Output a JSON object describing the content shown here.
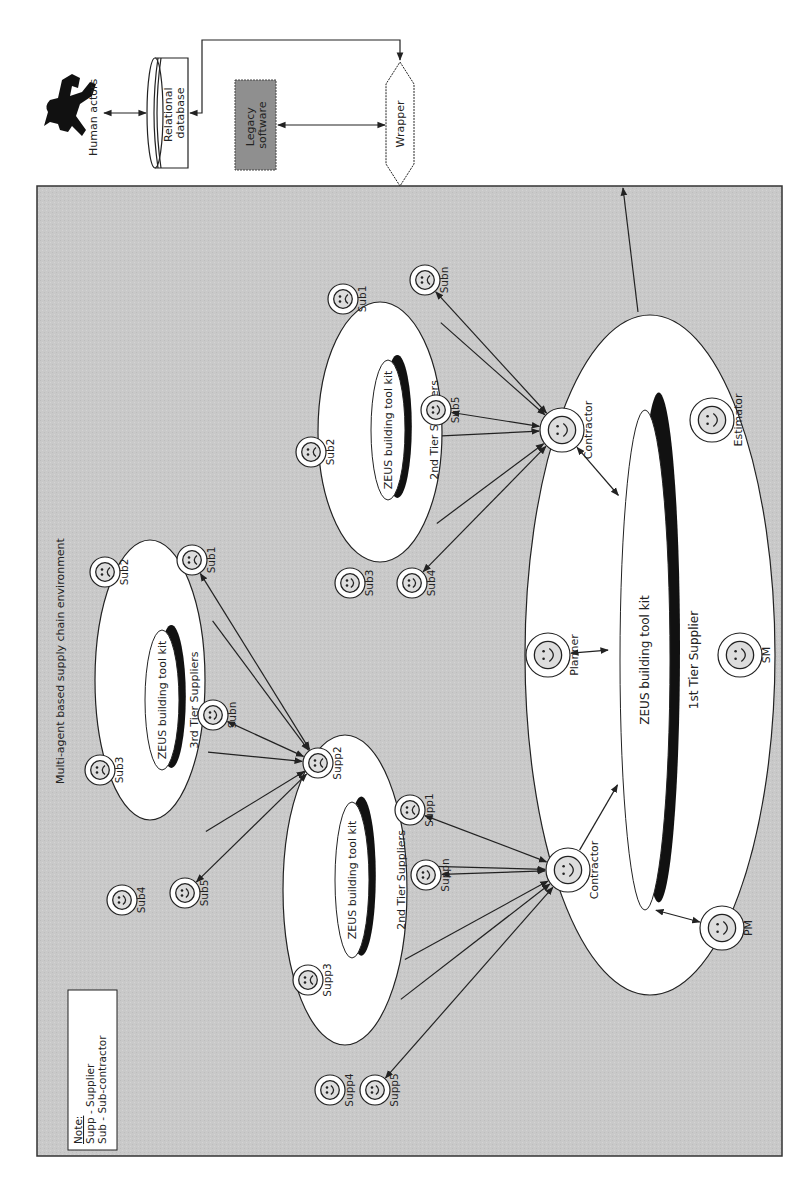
{
  "external": {
    "human_actors": "Human actors",
    "database": [
      "Relational",
      "database"
    ],
    "legacy": [
      "Legacy",
      "software"
    ],
    "wrapper": "Wrapper"
  },
  "environment": {
    "title": "Multi-agent based supply chain environment",
    "note": {
      "heading": "Note:",
      "lines": [
        "Supp - Supplier",
        "Sub - Sub-contractor"
      ]
    }
  },
  "groups": {
    "third_tier": {
      "label": "3rd Tier Suppliers",
      "toolkit": "ZEUS building tool kit",
      "agents": [
        {
          "label": "Sub1",
          "mood": "sad"
        },
        {
          "label": "Sub2",
          "mood": "sad"
        },
        {
          "label": "Sub3",
          "mood": "sad"
        },
        {
          "label": "Sub4",
          "mood": "happy"
        },
        {
          "label": "Sub5",
          "mood": "happy"
        },
        {
          "label": "Subn",
          "mood": "happy"
        }
      ]
    },
    "second_tier_supp": {
      "label": "2nd Tier Suppliers",
      "toolkit": "ZEUS building tool kit",
      "agents": [
        {
          "label": "Supp1",
          "mood": "sad"
        },
        {
          "label": "Supp2",
          "mood": "sad"
        },
        {
          "label": "Supp3",
          "mood": "sad"
        },
        {
          "label": "Supp4",
          "mood": "happy"
        },
        {
          "label": "Supp5",
          "mood": "happy"
        },
        {
          "label": "Suppn",
          "mood": "happy"
        }
      ]
    },
    "second_tier_sub": {
      "label": "2nd Tier Suppliers",
      "toolkit": "ZEUS building tool kit",
      "agents": [
        {
          "label": "Sub1",
          "mood": "sad"
        },
        {
          "label": "Sub2",
          "mood": "sad"
        },
        {
          "label": "Sub3",
          "mood": "happy"
        },
        {
          "label": "Sub4",
          "mood": "happy"
        },
        {
          "label": "Sub5",
          "mood": "happy"
        },
        {
          "label": "Subn",
          "mood": "sad"
        }
      ]
    },
    "first_tier": {
      "label": "1st Tier Supplier",
      "toolkit": "ZEUS building tool kit",
      "agents": [
        {
          "label": "Contractor",
          "mood": "happy"
        },
        {
          "label": "Contractor",
          "mood": "happy"
        },
        {
          "label": "Planner",
          "mood": "happy"
        },
        {
          "label": "SM",
          "mood": "happy"
        },
        {
          "label": "PM",
          "mood": "happy"
        },
        {
          "label": "Estimator",
          "mood": "happy"
        }
      ]
    }
  },
  "colors": {
    "environment_bg": "#c9c9c9",
    "legacy_bg": "#8f8f8f",
    "ink": "#222222"
  }
}
